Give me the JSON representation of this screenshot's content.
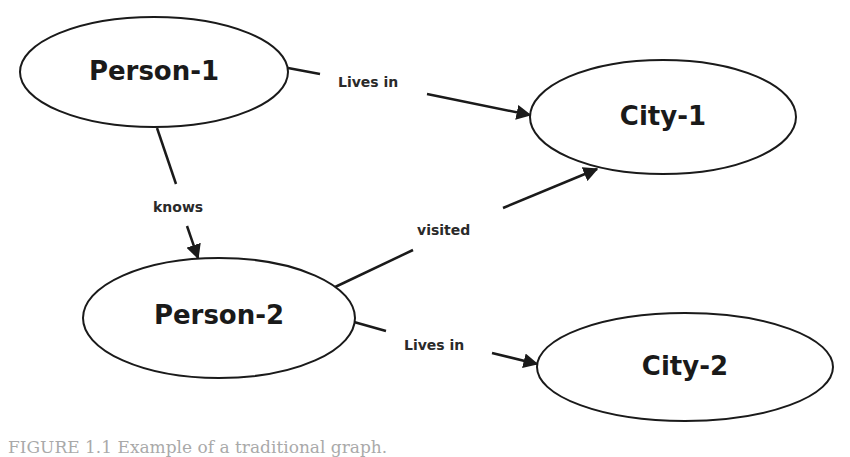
{
  "diagram": {
    "type": "graph",
    "nodes": [
      {
        "id": "person1",
        "label": "Person-1",
        "cx": 154,
        "cy": 72,
        "rx": 134,
        "ry": 55
      },
      {
        "id": "city1",
        "label": "City-1",
        "cx": 663,
        "cy": 117,
        "rx": 133,
        "ry": 57
      },
      {
        "id": "person2",
        "label": "Person-2",
        "cx": 219,
        "cy": 318,
        "rx": 136,
        "ry": 60
      },
      {
        "id": "city2",
        "label": "City-2",
        "cx": 685,
        "cy": 367,
        "rx": 148,
        "ry": 54
      }
    ],
    "edges": [
      {
        "from": "person1",
        "to": "city1",
        "label": "Lives in"
      },
      {
        "from": "person1",
        "to": "person2",
        "label": "knows"
      },
      {
        "from": "person2",
        "to": "city1",
        "label": "visited"
      },
      {
        "from": "person2",
        "to": "city2",
        "label": "Lives in"
      }
    ],
    "colors": {
      "stroke": "#1a1a1a",
      "fill": "#ffffff",
      "text": "#1a1a1a"
    }
  },
  "caption": "FIGURE 1.1  Example of a traditional graph."
}
